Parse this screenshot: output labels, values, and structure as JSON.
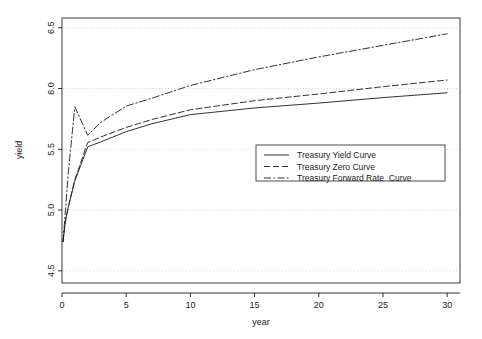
{
  "chart_data": {
    "type": "line",
    "title": "",
    "xlabel": "year",
    "ylabel": "yield",
    "xlim": [
      0,
      31
    ],
    "ylim": [
      4.4,
      6.58
    ],
    "grid": true,
    "grid_style": "dotted-horizontal",
    "legend_position": "center-right",
    "xticks": [
      0,
      5,
      10,
      15,
      20,
      25,
      30
    ],
    "xtick_labels": [
      "0",
      "5",
      "10",
      "15",
      "20",
      "25",
      "30"
    ],
    "yticks": [
      4.5,
      5.0,
      5.5,
      6.0,
      6.5
    ],
    "ytick_labels": [
      "4.5",
      "5.0",
      "5.5",
      "6.0",
      "6.5"
    ],
    "series": [
      {
        "name": "Treasury Yield Curve",
        "style": "solid",
        "color": "#1c1c1c",
        "x": [
          0.08,
          0.25,
          0.5,
          1,
          2,
          3,
          5,
          7,
          10,
          15,
          20,
          25,
          30
        ],
        "values": [
          4.74,
          4.9,
          5.03,
          5.24,
          5.52,
          5.56,
          5.645,
          5.71,
          5.785,
          5.84,
          5.88,
          5.925,
          5.965
        ]
      },
      {
        "name": "Treasury Zero Curve",
        "style": "dashed",
        "color": "#1c1c1c",
        "x": [
          0.08,
          0.25,
          0.5,
          1,
          2,
          3,
          5,
          7,
          10,
          15,
          20,
          25,
          30
        ],
        "values": [
          4.74,
          4.9,
          5.03,
          5.25,
          5.555,
          5.6,
          5.68,
          5.745,
          5.825,
          5.9,
          5.955,
          6.015,
          6.07
        ]
      },
      {
        "name": "Treasury Forward Rate  Curve",
        "style": "dashdot",
        "color": "#1c1c1c",
        "x": [
          0.08,
          0.5,
          1,
          2,
          3,
          5,
          7,
          10,
          15,
          20,
          25,
          30
        ],
        "values": [
          4.74,
          5.32,
          5.85,
          5.615,
          5.72,
          5.855,
          5.92,
          6.025,
          6.155,
          6.26,
          6.355,
          6.45
        ]
      }
    ]
  },
  "axes": {
    "x_title": "year",
    "y_title": "yield"
  },
  "legend": {
    "entries": [
      {
        "label": "Treasury Yield Curve",
        "style": "solid"
      },
      {
        "label": "Treasury Zero Curve",
        "style": "dashed"
      },
      {
        "label": "Treasury Forward Rate  Curve",
        "style": "dashdot"
      }
    ]
  }
}
